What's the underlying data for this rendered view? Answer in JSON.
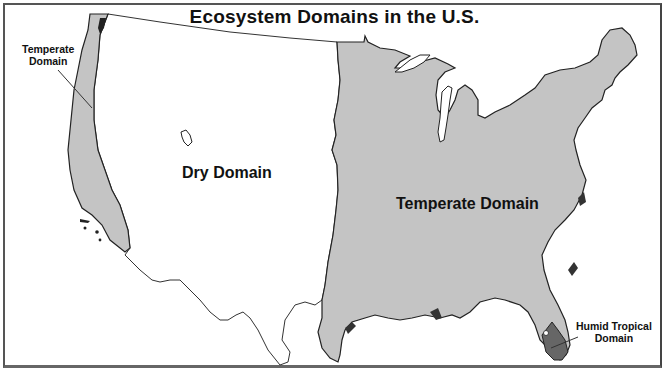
{
  "title": "Ecosystem Domains in the U.S.",
  "colors": {
    "temperate_fill": "#c4c4c4",
    "dry_fill": "#ffffff",
    "humid_tropical_fill": "#666666",
    "outline": "#222222",
    "frame": "#555555"
  },
  "regions": [
    {
      "id": "temperate-west",
      "name": "Temperate Domain",
      "label_line1": "Temperate",
      "label_line2": "Domain"
    },
    {
      "id": "dry",
      "name": "Dry Domain",
      "label": "Dry Domain"
    },
    {
      "id": "temperate-east",
      "name": "Temperate Domain",
      "label": "Temperate Domain"
    },
    {
      "id": "humid-tropical",
      "name": "Humid Tropical Domain",
      "label_line1": "Humid Tropical",
      "label_line2": "Domain"
    }
  ]
}
